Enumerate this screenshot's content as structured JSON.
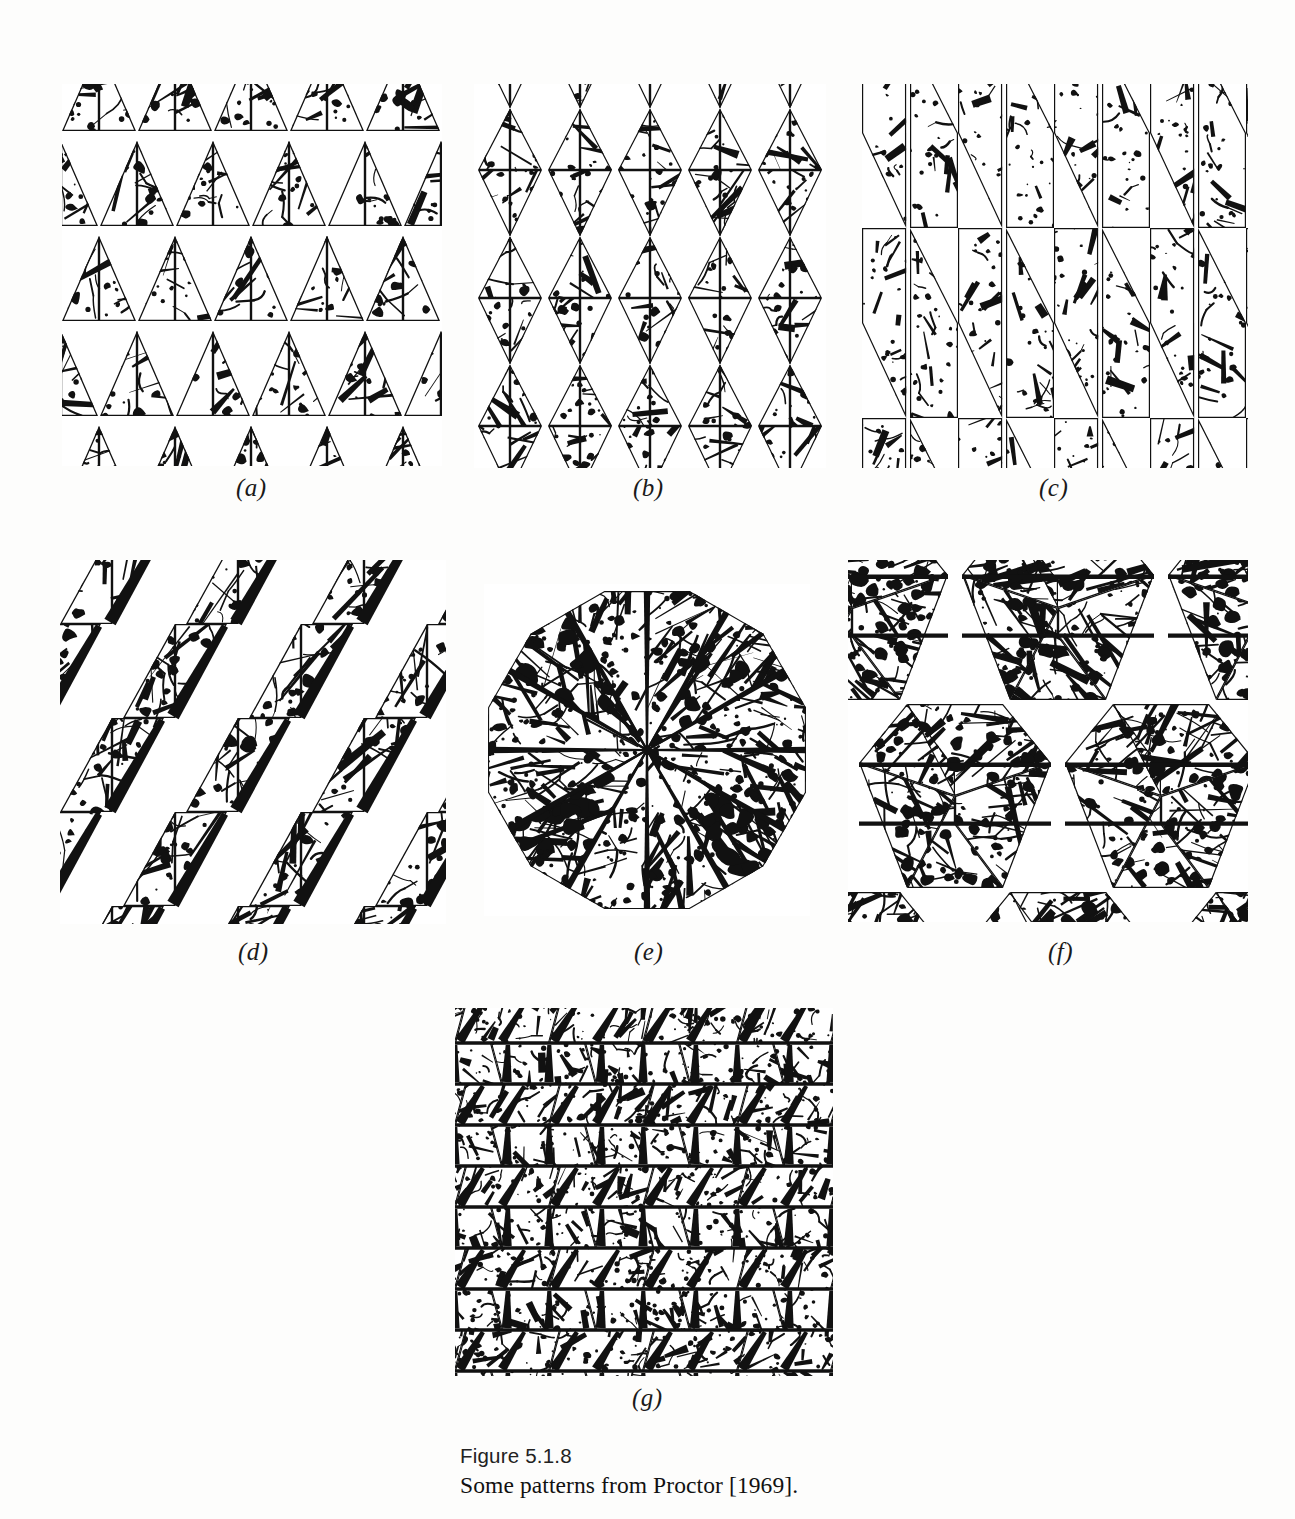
{
  "figure": {
    "caption_number": "Figure 5.1.8",
    "caption_text": "Some patterns from Proctor [1969].",
    "ink_color": "#111111",
    "paper_color": "#ffffff"
  },
  "panels": [
    {
      "id": "a",
      "label": "(a)",
      "motif": "triangle",
      "description": "Rows of upright decorated triangles, alternate rows offset by half a cell; triangles touch edge to edge.",
      "cols": 5,
      "rows": 4,
      "cell_w": 76,
      "cell_h": 95
    },
    {
      "id": "b",
      "label": "(b)",
      "motif": "triangle-pair",
      "description": "Columns of alternating up and down triangles forming vertical diamonds separated by white lens gaps.",
      "cols": 5,
      "rows": 3,
      "cell_w": 70,
      "cell_h": 128
    },
    {
      "id": "c",
      "label": "(c)",
      "motif": "lens-column",
      "description": "Tall narrow triangles joined at apexes forming elongated vertical lens and bowtie columns.",
      "cols": 4,
      "rows": 2,
      "cell_w": 96,
      "cell_h": 190
    },
    {
      "id": "d",
      "label": "(d)",
      "motif": "parallelogram",
      "description": "Slanted parallelogram tiles in staggered rows with large white rhombic gaps between them.",
      "cols": 3,
      "rows": 4,
      "cell_w": 126,
      "cell_h": 94
    },
    {
      "id": "e",
      "label": "(e)",
      "motif": "rosette",
      "description": "Circular rosette of twelve radial wedge sectors meeting at the centre, outer edge slightly polygonal.",
      "sectors": 12,
      "diameter": 322
    },
    {
      "id": "f",
      "label": "(f)",
      "motif": "hexagon-cluster",
      "description": "Honeycomb of hexagons, each built from four decorated trapezoids, separated by white channels.",
      "cols": 2,
      "rows": 3,
      "cell_w": 200,
      "cell_h": 186
    },
    {
      "id": "g",
      "label": "(g)",
      "motif": "brick-row",
      "description": "Dense brick-like courses of slanted rectangular tiles, alternating direction row by row.",
      "cols": 4,
      "rows": 9,
      "cell_w": 94,
      "cell_h": 41
    }
  ]
}
